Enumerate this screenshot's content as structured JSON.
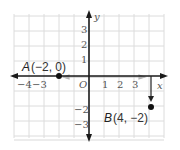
{
  "diagram": {
    "type": "coordinate-plane",
    "grid": {
      "x_range": [
        -5,
        5
      ],
      "y_range": [
        -4,
        4
      ],
      "color": "#d9d9d9"
    },
    "axes": {
      "x_label": "x",
      "y_label": "y",
      "origin_label": "O",
      "x_ticks": [
        {
          "value": -4,
          "label": "−4"
        },
        {
          "value": -3,
          "label": "−3"
        },
        {
          "value": 1,
          "label": "1"
        },
        {
          "value": 2,
          "label": "2"
        },
        {
          "value": 3,
          "label": "3"
        }
      ],
      "y_ticks": [
        {
          "value": 3,
          "label": "3"
        },
        {
          "value": 2,
          "label": "2"
        },
        {
          "value": 1,
          "label": "1"
        },
        {
          "value": -2,
          "label": "−2"
        },
        {
          "value": -3,
          "label": "−3"
        }
      ]
    },
    "points": [
      {
        "name": "A",
        "coords": "(−2, 0)",
        "x": -2,
        "y": 0
      },
      {
        "name": "B",
        "coords": "(4, −2)",
        "x": 4,
        "y": -2
      }
    ],
    "translation_arrows": [
      {
        "from": [
          -1.6,
          0
        ],
        "to": [
          3.6,
          0
        ],
        "color": "#b0b0b0"
      },
      {
        "from": [
          4,
          0
        ],
        "to": [
          4,
          -1.8
        ],
        "color": "#222222"
      }
    ],
    "colors": {
      "axis": "#1a1a1a",
      "point": "#111111"
    }
  }
}
